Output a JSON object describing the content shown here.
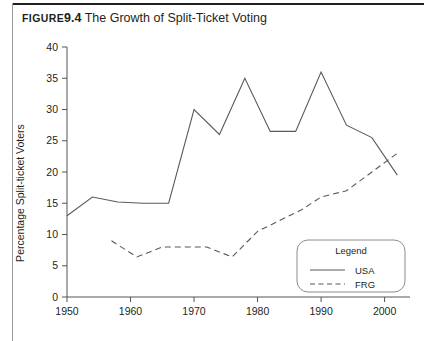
{
  "figure": {
    "label": "Figure",
    "number": "9.4",
    "title": "The Growth of Split-Ticket Voting"
  },
  "chart_data": {
    "type": "line",
    "title": "The Growth of Split-Ticket Voting",
    "xlabel": "",
    "ylabel": "Percentage Split-ticket Voters",
    "xlim": [
      1950,
      2004
    ],
    "ylim": [
      0,
      40
    ],
    "grid": false,
    "xticks": [
      1950,
      1960,
      1970,
      1980,
      1990,
      2000
    ],
    "xticklabels": [
      "1950",
      "1960",
      "1970",
      "1980",
      "1990",
      "2000"
    ],
    "yticks": [
      0,
      5,
      10,
      15,
      20,
      25,
      30,
      35,
      40
    ],
    "yticklabels": [
      "0",
      "5",
      "10",
      "15",
      "20",
      "25",
      "30",
      "35",
      "40"
    ],
    "legend": {
      "title": "Legend",
      "position": "lower-right",
      "entries": [
        {
          "name": "USA",
          "style": "solid"
        },
        {
          "name": "FRG",
          "style": "dashed"
        }
      ]
    },
    "series": [
      {
        "name": "USA",
        "style": "solid",
        "x": [
          1950,
          1954,
          1958,
          1962,
          1966,
          1970,
          1974,
          1978,
          1982,
          1986,
          1990,
          1994,
          1998,
          2002
        ],
        "y": [
          13.0,
          16.0,
          15.2,
          15.0,
          15.0,
          30.0,
          26.0,
          35.0,
          26.5,
          26.5,
          36.0,
          27.5,
          25.5,
          19.5
        ]
      },
      {
        "name": "FRG",
        "style": "dashed",
        "x": [
          1957,
          1961,
          1965,
          1969,
          1972,
          1976,
          1980,
          1983,
          1987,
          1990,
          1994,
          1998,
          2002
        ],
        "y": [
          9.0,
          6.4,
          8.0,
          8.0,
          8.0,
          6.4,
          10.5,
          12.0,
          14.0,
          16.0,
          17.0,
          20.0,
          23.0
        ]
      }
    ]
  }
}
